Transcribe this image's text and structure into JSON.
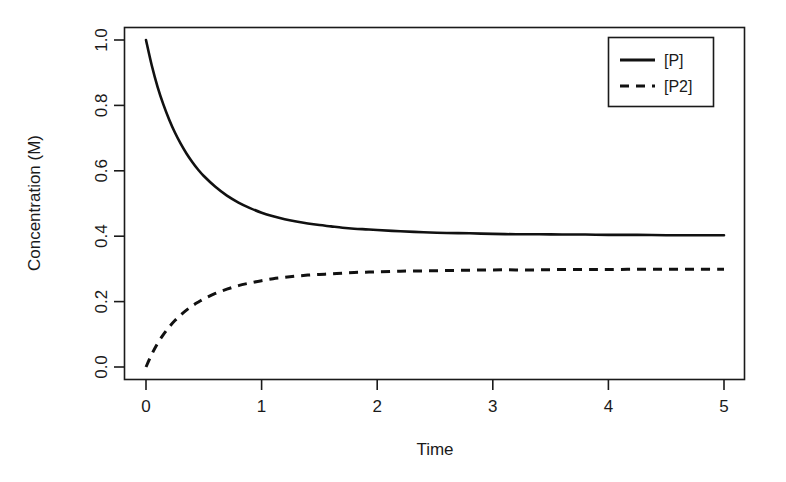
{
  "chart_data": {
    "type": "line",
    "title": "",
    "subtitle": "",
    "xlabel": "Time",
    "ylabel": "Concentration (M)",
    "xlim": [
      -0.13,
      5.13
    ],
    "ylim": [
      -0.04,
      1.04
    ],
    "xticks": [
      0,
      1,
      2,
      3,
      4,
      5
    ],
    "xticklabels": [
      "0",
      "1",
      "2",
      "3",
      "4",
      "5"
    ],
    "yticks": [
      0.0,
      0.2,
      0.4,
      0.6,
      0.8,
      1.0
    ],
    "yticklabels": [
      "0.0",
      "0.2",
      "0.4",
      "0.6",
      "0.8",
      "1.0"
    ],
    "grid": false,
    "frame": "box",
    "legend": {
      "position": "top-right",
      "border": true,
      "entries": [
        {
          "label": "[P]",
          "style": "solid",
          "color": "#111111"
        },
        {
          "label": "[P2]",
          "style": "dashed",
          "color": "#111111"
        }
      ]
    },
    "x": [
      0,
      0.05,
      0.1,
      0.15,
      0.2,
      0.25,
      0.3,
      0.35,
      0.4,
      0.45,
      0.5,
      0.6,
      0.7,
      0.8,
      0.9,
      1.0,
      1.1,
      1.2,
      1.3,
      1.4,
      1.5,
      1.6,
      1.7,
      1.8,
      1.9,
      2.0,
      2.2,
      2.4,
      2.6,
      2.8,
      3.0,
      3.2,
      3.4,
      3.6,
      3.8,
      4.0,
      4.25,
      4.5,
      4.75,
      5.0
    ],
    "series": [
      {
        "name": "[P]",
        "style": "solid",
        "color": "#111111",
        "values": [
          1.0,
          0.922,
          0.857,
          0.803,
          0.757,
          0.717,
          0.683,
          0.653,
          0.627,
          0.604,
          0.584,
          0.551,
          0.524,
          0.503,
          0.486,
          0.472,
          0.461,
          0.452,
          0.445,
          0.439,
          0.434,
          0.43,
          0.426,
          0.423,
          0.421,
          0.419,
          0.415,
          0.412,
          0.41,
          0.409,
          0.407,
          0.406,
          0.406,
          0.405,
          0.405,
          0.404,
          0.404,
          0.403,
          0.403,
          0.403
        ]
      },
      {
        "name": "[P2]",
        "style": "dashed",
        "color": "#111111",
        "values": [
          0.0,
          0.039,
          0.072,
          0.099,
          0.122,
          0.142,
          0.159,
          0.174,
          0.187,
          0.198,
          0.208,
          0.225,
          0.238,
          0.249,
          0.257,
          0.264,
          0.27,
          0.274,
          0.278,
          0.281,
          0.283,
          0.285,
          0.287,
          0.289,
          0.29,
          0.291,
          0.293,
          0.294,
          0.295,
          0.296,
          0.297,
          0.297,
          0.297,
          0.298,
          0.298,
          0.298,
          0.299,
          0.299,
          0.299,
          0.299
        ]
      }
    ],
    "notes": {
      "p_initial": 1.0,
      "p_asymptote": 0.4,
      "p2_initial": 0.0,
      "p2_asymptote": 0.31
    }
  },
  "colors": {
    "background": "#ffffff",
    "ink": "#1a1a1a",
    "curve": "#111111"
  }
}
